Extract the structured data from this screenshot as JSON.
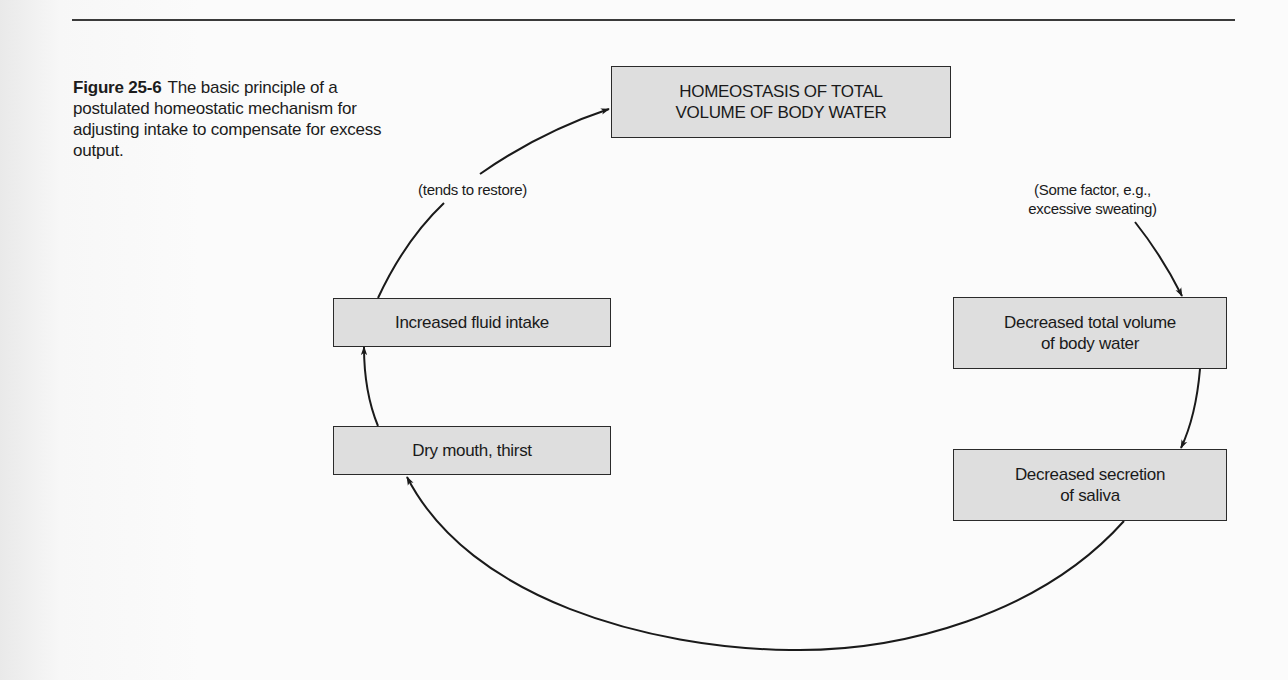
{
  "caption": {
    "figure_label": "Figure 25-6",
    "text": "The basic principle of a postulated homeostatic mechanism for adjusting intake to compensate for excess output."
  },
  "nodes": {
    "homeostasis": "HOMEOSTASIS OF TOTAL\nVOLUME OF BODY WATER",
    "decreased_volume": "Decreased total volume\nof body water",
    "decreased_saliva": "Decreased secretion\nof saliva",
    "dry_mouth": "Dry mouth, thirst",
    "increased_intake": "Increased fluid intake"
  },
  "edge_labels": {
    "some_factor": "(Some factor, e.g.,\nexcessive sweating)",
    "tends_to_restore": "(tends to restore)"
  },
  "colors": {
    "box_fill": "#dedede",
    "line": "#1a1a1a",
    "background": "#fbfbfb"
  }
}
